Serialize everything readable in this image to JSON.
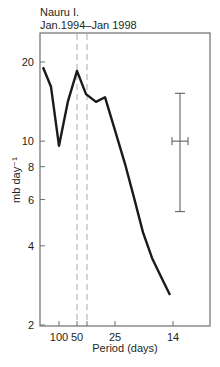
{
  "chart_data": {
    "type": "line",
    "title": "Nauru I.",
    "subtitle": "Jan.1994–Jan 1998",
    "xlabel": "Period (days)",
    "ylabel": "mb day⁻¹",
    "yscale": "log",
    "ylim": [
      2,
      25
    ],
    "y_ticks": [
      2,
      4,
      6,
      8,
      10,
      20
    ],
    "x_ticks": [
      {
        "label": "100",
        "px": 59
      },
      {
        "label": "50",
        "px": 77
      },
      {
        "label": "",
        "px": 87
      },
      {
        "label": "25",
        "px": 115
      },
      {
        "label": "14",
        "px": 173
      }
    ],
    "dashed_vlines_px": [
      77,
      87
    ],
    "series": [
      {
        "name": "spectrum",
        "points_px_x": [
          43,
          51,
          59,
          68,
          77,
          86,
          96,
          105,
          115,
          125,
          134,
          143,
          152,
          162,
          170
        ],
        "values": [
          19.1,
          16.1,
          9.6,
          14.2,
          18.5,
          15.1,
          14.1,
          14.7,
          11.0,
          8.2,
          6.1,
          4.5,
          3.6,
          3.0,
          2.6
        ]
      }
    ],
    "error_bar": {
      "x_px": 180,
      "center": 10,
      "low": 5.4,
      "high": 15.2,
      "h_halfwidth_px": 8
    },
    "grid": false,
    "legend": "none"
  }
}
